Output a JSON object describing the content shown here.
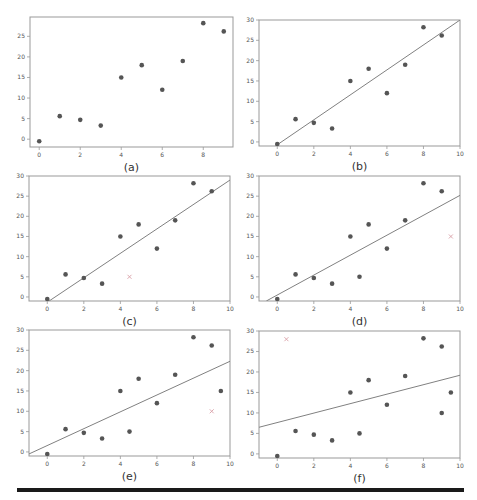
{
  "figure": {
    "width": 477,
    "height": 500,
    "colors": {
      "point": "#555555",
      "line": "#808080",
      "axis": "#999999",
      "removed_marker": "#d9a0a8",
      "rule": "#1a1a1a"
    }
  },
  "chart_data": [
    {
      "type": "scatter",
      "caption": "(a)",
      "panel": {
        "left": 30,
        "top": 17,
        "right": 233,
        "bottom": 147
      },
      "xlim": [
        -0.45,
        9.45
      ],
      "ylim": [
        -1.9,
        29.7
      ],
      "xticks": [
        0,
        2,
        4,
        6,
        8
      ],
      "yticks": [
        0,
        5,
        10,
        15,
        20,
        25
      ],
      "points": [
        [
          0,
          -0.5
        ],
        [
          1,
          5.6
        ],
        [
          2,
          4.7
        ],
        [
          3,
          3.3
        ],
        [
          4,
          15
        ],
        [
          5,
          18
        ],
        [
          6,
          12
        ],
        [
          7,
          19
        ],
        [
          8,
          28.2
        ],
        [
          9,
          26.2
        ]
      ],
      "line": null,
      "removed_point": null
    },
    {
      "type": "scatter",
      "caption": "(b)",
      "panel": {
        "left": 259,
        "top": 20,
        "right": 460,
        "bottom": 146
      },
      "xlim": [
        -1,
        10
      ],
      "ylim": [
        -1,
        30
      ],
      "xticks": [
        0,
        2,
        4,
        6,
        8,
        10
      ],
      "yticks": [
        0,
        5,
        10,
        15,
        20,
        25,
        30
      ],
      "points": [
        [
          0,
          -0.5
        ],
        [
          1,
          5.6
        ],
        [
          2,
          4.7
        ],
        [
          3,
          3.3
        ],
        [
          4,
          15
        ],
        [
          5,
          18
        ],
        [
          6,
          12
        ],
        [
          7,
          19
        ],
        [
          8,
          28.2
        ],
        [
          9,
          26.2
        ]
      ],
      "line": {
        "x0": -0.1,
        "y0": -1,
        "x1": 10,
        "y1": 30
      },
      "removed_point": null
    },
    {
      "type": "scatter",
      "caption": "(c)",
      "panel": {
        "left": 29,
        "top": 176,
        "right": 230,
        "bottom": 301
      },
      "xlim": [
        -1,
        10
      ],
      "ylim": [
        -1,
        30
      ],
      "xticks": [
        0,
        2,
        4,
        6,
        8,
        10
      ],
      "yticks": [
        0,
        5,
        10,
        15,
        20,
        25,
        30
      ],
      "points": [
        [
          0,
          -0.5
        ],
        [
          1,
          5.6
        ],
        [
          2,
          4.7
        ],
        [
          3,
          3.3
        ],
        [
          4,
          15
        ],
        [
          5,
          18
        ],
        [
          6,
          12
        ],
        [
          7,
          19
        ],
        [
          8,
          28.2
        ],
        [
          9,
          26.2
        ]
      ],
      "line": {
        "x0": 0.1,
        "y0": -1,
        "x1": 10,
        "y1": 29
      },
      "removed_point": [
        4.5,
        5
      ]
    },
    {
      "type": "scatter",
      "caption": "(d)",
      "panel": {
        "left": 259,
        "top": 176,
        "right": 460,
        "bottom": 301
      },
      "xlim": [
        -1,
        10
      ],
      "ylim": [
        -1,
        30
      ],
      "xticks": [
        0,
        2,
        4,
        6,
        8,
        10
      ],
      "yticks": [
        0,
        5,
        10,
        15,
        20,
        25,
        30
      ],
      "points": [
        [
          0,
          -0.5
        ],
        [
          1,
          5.6
        ],
        [
          2,
          4.7
        ],
        [
          3,
          3.3
        ],
        [
          4,
          15
        ],
        [
          4.5,
          5
        ],
        [
          5,
          18
        ],
        [
          6,
          12
        ],
        [
          7,
          19
        ],
        [
          8,
          28.2
        ],
        [
          9,
          26.2
        ]
      ],
      "line": {
        "x0": -0.6,
        "y0": -1,
        "x1": 10,
        "y1": 25.2
      },
      "removed_point": [
        9.5,
        15
      ]
    },
    {
      "type": "scatter",
      "caption": "(e)",
      "panel": {
        "left": 29,
        "top": 330,
        "right": 230,
        "bottom": 456
      },
      "xlim": [
        -1,
        10
      ],
      "ylim": [
        -1,
        30
      ],
      "xticks": [
        0,
        2,
        4,
        6,
        8,
        10
      ],
      "yticks": [
        0,
        5,
        10,
        15,
        20,
        25,
        30
      ],
      "points": [
        [
          0,
          -0.5
        ],
        [
          1,
          5.6
        ],
        [
          2,
          4.7
        ],
        [
          3,
          3.3
        ],
        [
          4,
          15
        ],
        [
          4.5,
          5
        ],
        [
          5,
          18
        ],
        [
          6,
          12
        ],
        [
          7,
          19
        ],
        [
          8,
          28.2
        ],
        [
          9,
          26.2
        ],
        [
          9.5,
          15
        ]
      ],
      "line": {
        "x0": -1,
        "y0": -0.5,
        "x1": 10,
        "y1": 22.3
      },
      "removed_point": [
        9,
        10
      ]
    },
    {
      "type": "scatter",
      "caption": "(f)",
      "panel": {
        "left": 259,
        "top": 331,
        "right": 460,
        "bottom": 458
      },
      "xlim": [
        -1,
        10
      ],
      "ylim": [
        -1,
        30
      ],
      "xticks": [
        0,
        2,
        4,
        6,
        8,
        10
      ],
      "yticks": [
        0,
        5,
        10,
        15,
        20,
        25,
        30
      ],
      "points": [
        [
          0,
          -0.5
        ],
        [
          1,
          5.6
        ],
        [
          2,
          4.7
        ],
        [
          3,
          3.3
        ],
        [
          4,
          15
        ],
        [
          4.5,
          5
        ],
        [
          5,
          18
        ],
        [
          6,
          12
        ],
        [
          7,
          19
        ],
        [
          8,
          28.2
        ],
        [
          9,
          26.2
        ],
        [
          9.5,
          15
        ],
        [
          9,
          10
        ]
      ],
      "line": {
        "x0": -1,
        "y0": 6.5,
        "x1": 10,
        "y1": 19.2
      },
      "removed_point": [
        0.5,
        28
      ]
    }
  ]
}
